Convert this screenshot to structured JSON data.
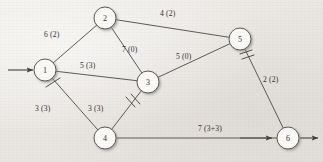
{
  "figure": {
    "kind": "network-flow-graph",
    "background_color": "#efedea",
    "line_color": "#4a4745",
    "node_fill": "#fbfaf8",
    "text_color": "#2e2c2b",
    "width": 323,
    "height": 162
  },
  "nodes": [
    {
      "id": "1",
      "label": "1",
      "cx": 45,
      "cy": 70,
      "r": 11
    },
    {
      "id": "2",
      "label": "2",
      "cx": 105,
      "cy": 18,
      "r": 11
    },
    {
      "id": "3",
      "label": "3",
      "cx": 148,
      "cy": 82,
      "r": 11
    },
    {
      "id": "4",
      "label": "4",
      "cx": 105,
      "cy": 138,
      "r": 11
    },
    {
      "id": "5",
      "label": "5",
      "cx": 240,
      "cy": 39,
      "r": 11
    },
    {
      "id": "6",
      "label": "6",
      "cx": 288,
      "cy": 138,
      "r": 11
    }
  ],
  "edges": [
    {
      "id": "e-1-2",
      "from": "1",
      "to": "2",
      "label": "6 (2)",
      "label_x": 44,
      "label_y": 30,
      "ticks": 0
    },
    {
      "id": "e-2-5",
      "from": "2",
      "to": "5",
      "label": "4 (2)",
      "label_x": 160,
      "label_y": 9,
      "ticks": 0
    },
    {
      "id": "e-2-3",
      "from": "2",
      "to": "3",
      "label": "7 (0)",
      "label_x": 122,
      "label_y": 45,
      "ticks": 0
    },
    {
      "id": "e-1-3",
      "from": "1",
      "to": "3",
      "label": "5 (3)",
      "label_x": 80,
      "label_y": 61,
      "ticks": 0
    },
    {
      "id": "e-3-5",
      "from": "3",
      "to": "5",
      "label": "5 (0)",
      "label_x": 176,
      "label_y": 52,
      "ticks": 0
    },
    {
      "id": "e-1-4",
      "from": "1",
      "to": "4",
      "label": "3 (3)",
      "label_x": 35,
      "label_y": 104,
      "ticks": 1
    },
    {
      "id": "e-4-3",
      "from": "4",
      "to": "3",
      "label": "3 (3)",
      "label_x": 88,
      "label_y": 104,
      "ticks": 2
    },
    {
      "id": "e-5-6",
      "from": "5",
      "to": "6",
      "label": "2 (2)",
      "label_x": 263,
      "label_y": 75,
      "ticks": 2
    },
    {
      "id": "e-4-6",
      "from": "4",
      "to": "6",
      "label": "7 (3+3)",
      "label_x": 198,
      "label_y": 124,
      "ticks": 0
    }
  ],
  "terminals": [
    {
      "id": "source-arrow",
      "name": "source-inflow-arrow",
      "direction": "into-node-1"
    },
    {
      "id": "sink-arrow",
      "name": "sink-outflow-arrow",
      "direction": "out-of-node-6"
    }
  ],
  "legend_note": "Each edge label reads capacity (flow)."
}
